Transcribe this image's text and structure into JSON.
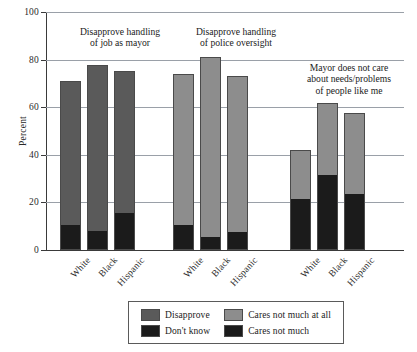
{
  "chart_data": {
    "type": "bar",
    "subtype": "stacked-bar-grouped",
    "title": "",
    "xlabel": "",
    "ylabel": "Percent",
    "ylim": [
      0,
      100
    ],
    "yticks": [
      0,
      20,
      40,
      60,
      80,
      100
    ],
    "ytick_labels": [
      "0",
      "20",
      "40",
      "60",
      "80",
      "100"
    ],
    "grid": "horizontal",
    "categories": [
      "White",
      "Black",
      "Hispanic"
    ],
    "legend_position": "bottom-center",
    "groups": [
      {
        "annotation": [
          "Disapprove handling",
          "of job as mayor"
        ],
        "bars": [
          {
            "category": "White",
            "total": 70.5,
            "segments": [
              {
                "series": "Disapprove",
                "value": 60.0
              },
              {
                "series": "Don't know",
                "value": 10.5
              }
            ]
          },
          {
            "category": "Black",
            "total": 77.5,
            "segments": [
              {
                "series": "Disapprove",
                "value": 69.5
              },
              {
                "series": "Don't know",
                "value": 8.0
              }
            ]
          },
          {
            "category": "Hispanic",
            "total": 75.0,
            "segments": [
              {
                "series": "Disapprove",
                "value": 59.5
              },
              {
                "series": "Don't know",
                "value": 15.5
              }
            ]
          }
        ]
      },
      {
        "annotation": [
          "Disapprove handling",
          "of police oversight"
        ],
        "bars": [
          {
            "category": "White",
            "total": 73.5,
            "segments": [
              {
                "series": "Disapprove",
                "value": 63.0
              },
              {
                "series": "Don't know",
                "value": 10.5
              }
            ]
          },
          {
            "category": "Black",
            "total": 80.5,
            "segments": [
              {
                "series": "Disapprove",
                "value": 75.0
              },
              {
                "series": "Don't know",
                "value": 5.5
              }
            ]
          },
          {
            "category": "Hispanic",
            "total": 72.5,
            "segments": [
              {
                "series": "Disapprove",
                "value": 65.0
              },
              {
                "series": "Don't know",
                "value": 7.5
              }
            ]
          }
        ]
      },
      {
        "annotation": [
          "Mayor does not care",
          "about needs/problems",
          "of people like me"
        ],
        "bars": [
          {
            "category": "White",
            "total": 41.5,
            "segments": [
              {
                "series": "Cares not much at all",
                "value": 20.0
              },
              {
                "series": "Cares not much",
                "value": 21.5
              }
            ]
          },
          {
            "category": "Black",
            "total": 61.5,
            "segments": [
              {
                "series": "Cares not much at all",
                "value": 30.0
              },
              {
                "series": "Cares not much",
                "value": 31.5
              }
            ]
          },
          {
            "category": "Hispanic",
            "total": 57.0,
            "segments": [
              {
                "series": "Cares not much at all",
                "value": 33.5
              },
              {
                "series": "Cares not much",
                "value": 23.5
              }
            ]
          }
        ]
      }
    ],
    "legend": [
      {
        "label": "Disapprove",
        "color": "#5a5a5a"
      },
      {
        "label": "Cares not much at all",
        "color": "#8d8d8d"
      },
      {
        "label": "Don't know",
        "color": "#1b1b1b"
      },
      {
        "label": "Cares not much",
        "color": "#1b1b1b"
      }
    ],
    "colors": {
      "disapprove_group1": "#5a5a5a",
      "disapprove_group2": "#8d8d8d",
      "dont_know": "#1b1b1b",
      "cares_not_much_at_all": "#8d8d8d",
      "cares_not_much": "#1b1b1b",
      "axis": "#3a3a3a",
      "grid": "#9aa0a8",
      "bar_outline": "#4a4a4a"
    }
  },
  "axis": {
    "y_title": "Percent"
  }
}
